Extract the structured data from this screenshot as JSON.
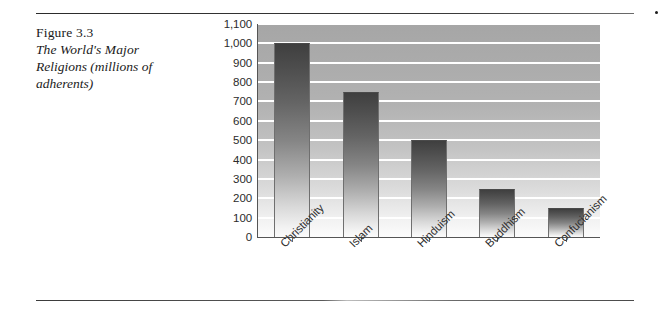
{
  "figure": {
    "number_label": "Figure 3.3",
    "title_line1": "The World's Major",
    "title_line2": "Religions (millions of",
    "title_line3": "adherents)",
    "title_full": "The World's Major Religions (millions of adherents)"
  },
  "colors": {
    "plot_background_top": "#a6a6a6",
    "plot_background_bottom": "#fcfcfc",
    "gridline": "#ffffff",
    "bar_top": "#3f3f3f",
    "bar_bottom": "#fbfbfb",
    "bar_outline": "#6f6f6f",
    "axis": "#555555",
    "rule": "#2b2b2b",
    "text": "#1a1a1a"
  },
  "chart_data": {
    "type": "bar",
    "title": "The World's Major Religions (millions of adherents)",
    "xlabel": "",
    "ylabel": "",
    "ylim": [
      0,
      1100
    ],
    "ytick_step": 100,
    "grid": true,
    "legend": false,
    "orientation": "vertical",
    "categories": [
      "Christianity",
      "Islam",
      "Hinduism",
      "Buddhism",
      "Confucianism"
    ],
    "values": [
      1000,
      750,
      500,
      250,
      150
    ],
    "ytick_labels": [
      "1,100",
      "1,000",
      "900",
      "800",
      "700",
      "600",
      "500",
      "400",
      "300",
      "200",
      "100",
      "0"
    ],
    "ytick_values": [
      1100,
      1000,
      900,
      800,
      700,
      600,
      500,
      400,
      300,
      200,
      100,
      0
    ],
    "units": "millions of adherents"
  }
}
